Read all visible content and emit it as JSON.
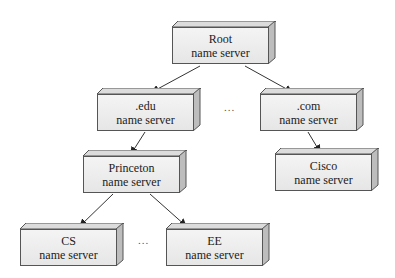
{
  "nodes": {
    "root": {
      "line1": "Root",
      "line2": "name server"
    },
    "edu": {
      "line1": ".edu",
      "line2": "name server"
    },
    "com": {
      "line1": ".com",
      "line2": "name server"
    },
    "princeton": {
      "line1": "Princeton",
      "line2": "name server"
    },
    "cisco": {
      "line1": "Cisco",
      "line2": "name server"
    },
    "cs": {
      "line1": "CS",
      "line2": "name server"
    },
    "ee": {
      "line1": "EE",
      "line2": "name server"
    }
  },
  "ellipsis": {
    "top": "...",
    "bottom": "..."
  },
  "colors": {
    "box_fill": "#ececec",
    "box_border": "#555555",
    "edge": "#333333"
  }
}
